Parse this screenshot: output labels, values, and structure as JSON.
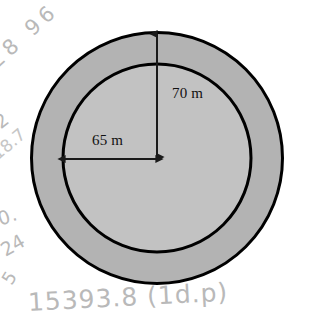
{
  "figure": {
    "type": "annulus-diagram",
    "background_color": "#ffffff",
    "outline_color": "#000000",
    "ring_fill_color": "#b3b3b3",
    "inner_fill_color": "#c2c2c2",
    "center": {
      "x": 157,
      "y": 158
    },
    "outer_radius_px": 127,
    "inner_radius_px": 95,
    "outline_width_px": 3
  },
  "dimensions": [
    {
      "name": "outer-radius",
      "label": "70 m",
      "value": 70,
      "unit": "m",
      "from": "center",
      "to": "outer-circle-top",
      "orientation": "vertical"
    },
    {
      "name": "inner-radius",
      "label": "65 m",
      "value": 65,
      "unit": "m",
      "from": "center",
      "to": "inner-circle-left",
      "orientation": "horizontal"
    }
  ],
  "handwritten_notes": {
    "color": "#b9b9b9",
    "top_left": "28 96",
    "mid_left": ".2",
    "mid_left_2": "18.7",
    "lower_left": "0.",
    "lower_left_2": "24",
    "lower_left_3": "5",
    "bottom": "15393.8 (1d.p)"
  }
}
